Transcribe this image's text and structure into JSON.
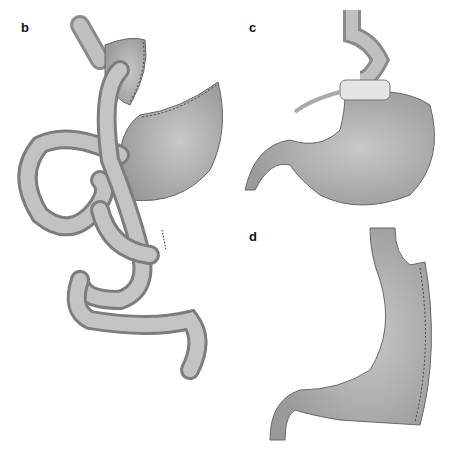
{
  "panels": [
    {
      "label": "b",
      "depicts": "Roux-en-Y gastric bypass"
    },
    {
      "label": "c",
      "depicts": "Adjustable gastric band"
    },
    {
      "label": "d",
      "depicts": "Sleeve gastrectomy"
    }
  ],
  "colors": {
    "tissue": "#b8b8b8",
    "tissue_light": "#d6d6d6",
    "tissue_dark": "#8a8a8a",
    "outline": "#6a6a6a",
    "staple": "#444444",
    "band": "#e4e4e4"
  }
}
